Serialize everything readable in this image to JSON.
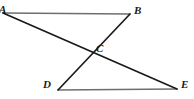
{
  "figure": {
    "type": "geometry-diagram",
    "width": 194,
    "height": 99,
    "background_color": "#ffffff",
    "stroke_color_primary": "#1a1a1a",
    "stroke_color_secondary": "#6e6e6e",
    "label_color": "#1a1a1a",
    "points": [
      {
        "id": "A",
        "label": "A",
        "x": 3,
        "y": 13,
        "label_x": -1,
        "label_y": 4,
        "clipped": true
      },
      {
        "id": "B",
        "label": "B",
        "x": 130,
        "y": 14,
        "label_x": 134,
        "label_y": 5
      },
      {
        "id": "C",
        "label": "C",
        "x": 90,
        "y": 50,
        "label_x": 96,
        "label_y": 43
      },
      {
        "id": "D",
        "label": "D",
        "x": 58,
        "y": 90,
        "label_x": 43,
        "label_y": 79
      },
      {
        "id": "E",
        "label": "E",
        "x": 177,
        "y": 89,
        "label_x": 181,
        "label_y": 79
      }
    ],
    "segments": [
      {
        "id": "AB",
        "from": "A",
        "to": "B",
        "x1": 3,
        "y1": 13,
        "x2": 130,
        "y2": 14,
        "color": "#6e6e6e",
        "width": 1.6
      },
      {
        "id": "DE",
        "from": "D",
        "to": "E",
        "x1": 58,
        "y1": 90,
        "x2": 177,
        "y2": 89,
        "color": "#6e6e6e",
        "width": 1.6
      },
      {
        "id": "AE",
        "from": "A",
        "to": "E",
        "x1": 3,
        "y1": 13,
        "x2": 177,
        "y2": 89,
        "color": "#1a1a1a",
        "width": 1.7
      },
      {
        "id": "BD",
        "from": "B",
        "to": "D",
        "x1": 130,
        "y1": 14,
        "x2": 58,
        "y2": 90,
        "color": "#1a1a1a",
        "width": 1.7
      }
    ]
  }
}
